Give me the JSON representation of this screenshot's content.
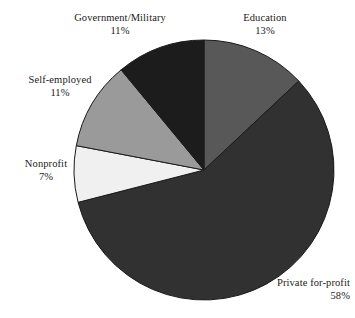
{
  "chart_data": {
    "type": "pie",
    "title": "",
    "subtitle": "",
    "xlabel": "",
    "ylabel": "",
    "legend_position": "none",
    "grid": false,
    "start_angle_deg": 0,
    "direction": "clockwise",
    "categories": [
      "Education",
      "Private for-profit",
      "Nonprofit",
      "Self-employed",
      "Government/Military"
    ],
    "values": [
      13,
      58,
      7,
      11,
      11
    ],
    "value_unit": "%",
    "slices": [
      {
        "label": "Education",
        "value": 13,
        "percent_text": "13%",
        "color": "#585858",
        "label_align": "center"
      },
      {
        "label": "Private for-profit",
        "value": 58,
        "percent_text": "58%",
        "color": "#313131",
        "label_align": "right"
      },
      {
        "label": "Nonprofit",
        "value": 7,
        "percent_text": "7%",
        "color": "#f0f0f0",
        "label_align": "center"
      },
      {
        "label": "Self-employed",
        "value": 11,
        "percent_text": "11%",
        "color": "#9a9a9a",
        "label_align": "center"
      },
      {
        "label": "Government/Military",
        "value": 11,
        "percent_text": "11%",
        "color": "#1c1c1c",
        "label_align": "center"
      }
    ],
    "geometry": {
      "center_x": 204,
      "center_y": 170,
      "radius": 130
    },
    "outline_color": "#1a1a1a",
    "background_color": "#ffffff"
  }
}
